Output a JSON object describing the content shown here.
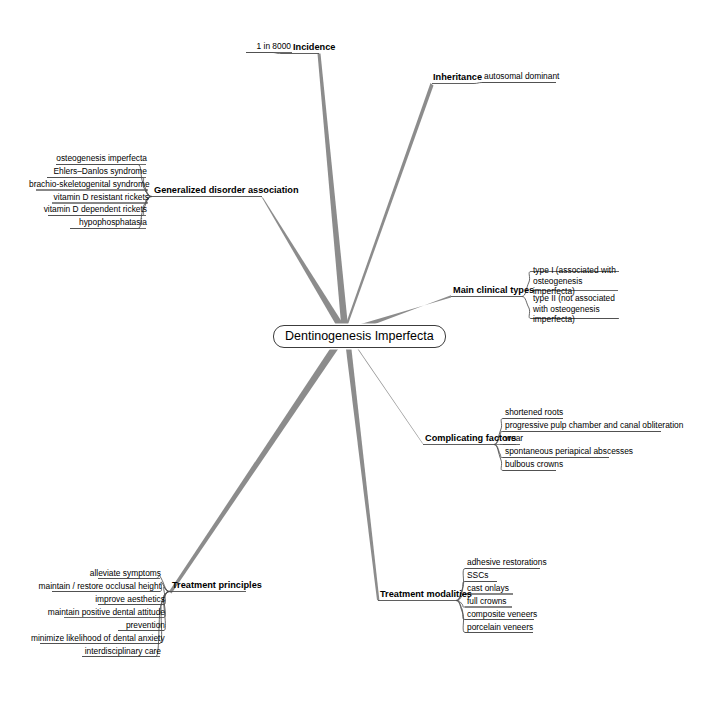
{
  "diagram": {
    "type": "mind-map",
    "title": "Dentinogenesis Imperfecta",
    "root": "Dentinogenesis Imperfecta",
    "line_color": "#8c8c8c",
    "text_color": "#000000",
    "background": "#ffffff"
  },
  "branches": [
    {
      "id": "incidence",
      "label": "Incidence",
      "side": "left",
      "children": [
        "1 in 8000"
      ]
    },
    {
      "id": "inheritance",
      "label": "Inheritance",
      "side": "right",
      "children": [
        "autosomal dominant"
      ]
    },
    {
      "id": "generalized-disorder-association",
      "label": "Generalized disorder association",
      "side": "left",
      "children": [
        "osteogenesis imperfecta",
        "Ehlers–Danlos syndrome",
        "brachio-skeletogenital syndrome",
        "vitamin D resistant rickets",
        "vitamin D dependent rickets",
        "hypophosphatasia"
      ]
    },
    {
      "id": "main-clinical-types",
      "label": "Main clinical types",
      "side": "right",
      "children": [
        "type I (associated with osteogenesis imperfecta)",
        "type II (not associated with osteogenesis imperfecta)"
      ]
    },
    {
      "id": "complicating-factors",
      "label": "Complicating factors",
      "side": "right",
      "children": [
        "shortened roots",
        "progressive pulp chamber and canal obliteration",
        "wear",
        "spontaneous periapical abscesses",
        "bulbous crowns"
      ]
    },
    {
      "id": "treatment-modalities",
      "label": "Treatment modalities",
      "side": "right",
      "children": [
        "adhesive restorations",
        "SSCs",
        "cast onlays",
        "full crowns",
        "composite veneers",
        "porcelain veneers"
      ]
    },
    {
      "id": "treatment-principles",
      "label": "Treatment principles",
      "side": "left",
      "children": [
        "alleviate symptoms",
        "maintain / restore occlusal height",
        "improve aesthetics",
        "maintain positive dental attitude",
        "prevention",
        "minimize likelihood of dental anxiety",
        "interdisciplinary care"
      ]
    }
  ]
}
